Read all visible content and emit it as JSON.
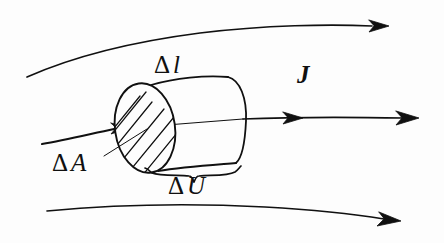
{
  "figure": {
    "background_color": "#fdfdfd",
    "ink_color": "#101010",
    "width": 444,
    "height": 243
  },
  "labels": {
    "delta_l": {
      "delta": "Δ",
      "symbol": "l",
      "text": "Δ l",
      "meaning": "length-of-volume-element"
    },
    "delta_a": {
      "delta": "Δ",
      "symbol": "A",
      "text": "Δ A",
      "meaning": "cross-sectional-area"
    },
    "delta_u": {
      "delta": "Δ",
      "symbol": "U",
      "text": "Δ U",
      "meaning": "volume-of-element"
    },
    "current_density": {
      "symbol": "J",
      "text": "J",
      "meaning": "current-density-vector"
    }
  },
  "streamlines": [
    {
      "name": "upper-streamline",
      "arrow": "right",
      "arrow_tip_x": 386,
      "arrow_tip_y": 26
    },
    {
      "name": "middle-streamline",
      "arrow": "right",
      "arrow_tip_x": 416,
      "arrow_tip_y": 118
    },
    {
      "name": "lower-streamline",
      "arrow": "right",
      "arrow_tip_x": 399,
      "arrow_tip_y": 220
    }
  ],
  "cylinder": {
    "name": "volume-element-cylinder",
    "front_face": "hatched-ellipse",
    "hatching": "diagonal",
    "axis_arrow": "right"
  },
  "brace": {
    "name": "delta-u-brace",
    "orientation": "down",
    "span_x": [
      145,
      241
    ]
  },
  "leader_line": {
    "name": "delta-a-leader",
    "from_x": 104,
    "from_y": 155,
    "to_x": 145,
    "to_y": 128
  }
}
